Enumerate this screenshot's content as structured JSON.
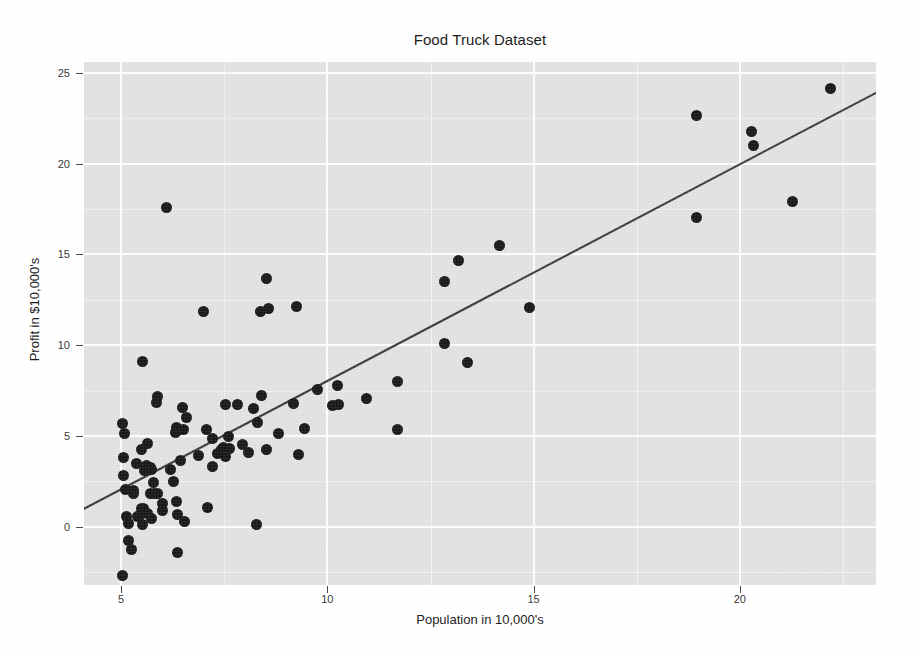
{
  "chart_data": {
    "type": "scatter",
    "title": "Food Truck Dataset",
    "xlabel": "Population in 10,000's",
    "ylabel": "Profit in $10,000's",
    "xlim": [
      4.1,
      23.3
    ],
    "ylim": [
      -3.2,
      25.6
    ],
    "xticks": [
      5,
      10,
      15,
      20
    ],
    "yticks": [
      0,
      5,
      10,
      15,
      20,
      25
    ],
    "xticklabels": [
      "5",
      "10",
      "15",
      "20"
    ],
    "yticklabels": [
      "0",
      "5",
      "10",
      "15",
      "20",
      "25"
    ],
    "grid": true,
    "legend": null,
    "background": "#e4e4e4",
    "gridline_color": "#ffffff",
    "point_color": "#151515",
    "line_color": "#3a3a3a",
    "series": [
      {
        "name": "Food truck profit by city population",
        "marker": "filled-circle",
        "points": [
          [
            6.1101,
            17.592
          ],
          [
            5.5277,
            9.1302
          ],
          [
            8.5186,
            13.662
          ],
          [
            7.0032,
            11.854
          ],
          [
            5.8598,
            6.8233
          ],
          [
            8.3829,
            11.886
          ],
          [
            7.4764,
            4.3483
          ],
          [
            8.5781,
            12.0
          ],
          [
            6.4862,
            6.5987
          ],
          [
            5.0546,
            3.8166
          ],
          [
            5.7107,
            3.2522
          ],
          [
            14.164,
            15.505
          ],
          [
            5.734,
            3.1551
          ],
          [
            8.4084,
            7.2258
          ],
          [
            5.6407,
            0.71618
          ],
          [
            5.3794,
            3.5129
          ],
          [
            6.3654,
            5.3048
          ],
          [
            5.1301,
            0.56077
          ],
          [
            6.4296,
            3.6518
          ],
          [
            7.0708,
            5.3893
          ],
          [
            6.1891,
            3.1386
          ],
          [
            20.27,
            21.767
          ],
          [
            5.4901,
            4.263
          ],
          [
            6.3261,
            5.1875
          ],
          [
            5.5649,
            3.0825
          ],
          [
            18.945,
            22.638
          ],
          [
            12.828,
            13.501
          ],
          [
            10.957,
            7.0467
          ],
          [
            13.176,
            14.692
          ],
          [
            22.203,
            24.147
          ],
          [
            5.2524,
            -1.22
          ],
          [
            6.5894,
            5.9966
          ],
          [
            9.2482,
            12.134
          ],
          [
            5.8918,
            1.8495
          ],
          [
            8.2111,
            6.5426
          ],
          [
            7.9334,
            4.5623
          ],
          [
            8.0959,
            4.1164
          ],
          [
            5.6063,
            3.3928
          ],
          [
            12.836,
            10.117
          ],
          [
            6.3534,
            5.4974
          ],
          [
            5.4069,
            0.55657
          ],
          [
            6.8825,
            3.9115
          ],
          [
            11.708,
            5.3854
          ],
          [
            5.7737,
            2.4406
          ],
          [
            7.8247,
            6.7318
          ],
          [
            7.0931,
            1.0463
          ],
          [
            5.0702,
            5.1337
          ],
          [
            5.8014,
            1.844
          ],
          [
            11.7,
            8.0043
          ],
          [
            5.5416,
            1.0179
          ],
          [
            7.5402,
            6.7504
          ],
          [
            5.3077,
            1.8396
          ],
          [
            7.4239,
            4.2885
          ],
          [
            7.6031,
            4.9981
          ],
          [
            6.3328,
            1.4233
          ],
          [
            6.3589,
            -1.4211
          ],
          [
            6.2742,
            2.4756
          ],
          [
            5.6397,
            4.6042
          ],
          [
            9.3102,
            3.9624
          ],
          [
            9.4536,
            5.4141
          ],
          [
            8.8254,
            5.1694
          ],
          [
            5.1793,
            -0.74279
          ],
          [
            21.279,
            17.929
          ],
          [
            14.908,
            12.054
          ],
          [
            18.959,
            17.054
          ],
          [
            7.2182,
            4.8852
          ],
          [
            8.2951,
            5.7442
          ],
          [
            10.236,
            7.7754
          ],
          [
            5.4994,
            1.0173
          ],
          [
            20.341,
            20.992
          ],
          [
            10.136,
            6.6799
          ],
          [
            7.3345,
            4.0259
          ],
          [
            6.0062,
            1.2784
          ],
          [
            7.2259,
            3.3411
          ],
          [
            5.0269,
            -2.6807
          ],
          [
            6.5479,
            0.29678
          ],
          [
            7.5386,
            3.8845
          ],
          [
            5.0365,
            5.7014
          ],
          [
            10.274,
            6.7526
          ],
          [
            5.1077,
            2.0576
          ],
          [
            5.7292,
            0.47953
          ],
          [
            5.1884,
            0.20421
          ],
          [
            6.3557,
            0.67861
          ],
          [
            9.7687,
            7.5435
          ],
          [
            6.5159,
            5.3436
          ],
          [
            8.5172,
            4.2415
          ],
          [
            9.1802,
            6.7981
          ],
          [
            6.002,
            0.92695
          ],
          [
            5.5204,
            0.152
          ],
          [
            5.0594,
            2.8214
          ],
          [
            5.7077,
            1.8451
          ],
          [
            7.6366,
            4.2959
          ],
          [
            5.8707,
            7.2029
          ],
          [
            5.3054,
            1.9869
          ],
          [
            8.2934,
            0.14454
          ],
          [
            13.394,
            9.0551
          ],
          [
            5.4369,
            0.61705
          ]
        ]
      }
    ],
    "fit_line": {
      "name": "Linear regression fit",
      "slope": 1.1931,
      "intercept": -3.8958,
      "x_start": 4.1,
      "x_end": 23.3
    }
  }
}
